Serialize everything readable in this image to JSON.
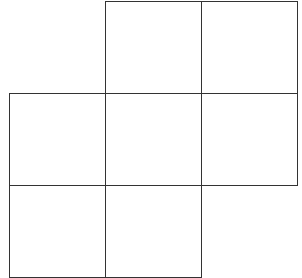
{
  "label": "(b)",
  "label_visible_fragment": ")",
  "grid": {
    "rows": 3,
    "cols": 3,
    "origin": {
      "x": 9,
      "y": 1
    },
    "cell_width": 96,
    "cell_height": 92,
    "line_color": "#333333",
    "cells": [
      {
        "row": 0,
        "col": 1
      },
      {
        "row": 0,
        "col": 2
      },
      {
        "row": 1,
        "col": 0
      },
      {
        "row": 1,
        "col": 1
      },
      {
        "row": 1,
        "col": 2
      },
      {
        "row": 2,
        "col": 0
      },
      {
        "row": 2,
        "col": 1
      }
    ]
  }
}
